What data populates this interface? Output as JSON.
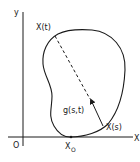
{
  "diagram": {
    "axes": {
      "y_label": "y",
      "x_label": "X",
      "origin_label": "O"
    },
    "points": {
      "x_t": "X(t)",
      "x_s": "X(s)",
      "x0_base": "X",
      "x0_sub": "O"
    },
    "vector_label": "g(s,t)",
    "colors": {
      "ink": "#1a1a1a",
      "background": "#ffffff"
    }
  }
}
